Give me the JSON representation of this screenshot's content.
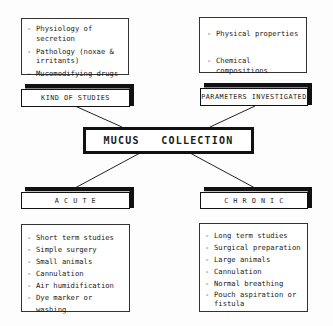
{
  "center": {
    "label": "MUCUS   COLLECTION"
  },
  "kind_of_studies": {
    "label": "KIND  OF  STUDIES",
    "items": [
      "Physiology of secretion",
      "Pathology  (noxae  &  irritants)",
      "Mucomodifying drugs"
    ]
  },
  "parameters_investigated": {
    "label": "PARAMETERS INVESTIGATED",
    "items": [
      "Physical properties",
      "Chemical compositions"
    ]
  },
  "acute": {
    "label": "A C U T E",
    "items": [
      "Short term studies",
      "Simple surgery",
      "Small animals",
      "Cannulation",
      "Air humidification",
      "Dye marker or washing"
    ]
  },
  "chronic": {
    "label": "C H R O N I C",
    "items": [
      "Long term studies",
      "Surgical preparation",
      "Large animals",
      "Cannulation",
      "Normal breathing",
      "Pouch aspiration or fistula"
    ]
  }
}
